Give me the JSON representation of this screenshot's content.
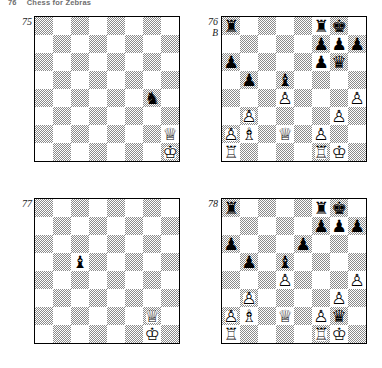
{
  "running_head": {
    "folio": "76",
    "title": "Chess for Zebras"
  },
  "pieces": {
    "wK": "♔",
    "wQ": "♕",
    "wR": "♖",
    "wB": "♗",
    "wN": "♘",
    "wP": "♙",
    "bK": "♚",
    "bQ": "♛",
    "bR": "♜",
    "bB": "♝",
    "bN": "♞",
    "bP": "♟"
  },
  "diagrams": [
    {
      "number": "75",
      "side_to_move": "",
      "x": 34,
      "y": 16,
      "label_x": 10,
      "label_y": 17,
      "position": [
        {
          "square": "g4",
          "piece": "bN"
        },
        {
          "square": "h2",
          "piece": "wQ"
        },
        {
          "square": "h1",
          "piece": "wK"
        }
      ]
    },
    {
      "number": "76",
      "side_to_move": "B",
      "x": 221,
      "y": 16,
      "label_x": 196,
      "label_y": 17,
      "position": [
        {
          "square": "a8",
          "piece": "bR"
        },
        {
          "square": "f8",
          "piece": "bR"
        },
        {
          "square": "g8",
          "piece": "bK"
        },
        {
          "square": "f7",
          "piece": "bP"
        },
        {
          "square": "g7",
          "piece": "bP"
        },
        {
          "square": "h7",
          "piece": "bP"
        },
        {
          "square": "a6",
          "piece": "bP"
        },
        {
          "square": "f6",
          "piece": "bP"
        },
        {
          "square": "g6",
          "piece": "bQ"
        },
        {
          "square": "b5",
          "piece": "bP"
        },
        {
          "square": "d5",
          "piece": "bB"
        },
        {
          "square": "d4",
          "piece": "wP"
        },
        {
          "square": "h4",
          "piece": "wP"
        },
        {
          "square": "b3",
          "piece": "wP"
        },
        {
          "square": "g3",
          "piece": "wP"
        },
        {
          "square": "a2",
          "piece": "wP"
        },
        {
          "square": "b2",
          "piece": "wB"
        },
        {
          "square": "d2",
          "piece": "wQ"
        },
        {
          "square": "f2",
          "piece": "wP"
        },
        {
          "square": "a1",
          "piece": "wR"
        },
        {
          "square": "f1",
          "piece": "wR"
        },
        {
          "square": "g1",
          "piece": "wK"
        }
      ]
    },
    {
      "number": "77",
      "side_to_move": "",
      "x": 34,
      "y": 198,
      "label_x": 10,
      "label_y": 199,
      "position": [
        {
          "square": "c5",
          "piece": "bB"
        },
        {
          "square": "g2",
          "piece": "wQ"
        },
        {
          "square": "g1",
          "piece": "wK"
        }
      ]
    },
    {
      "number": "78",
      "side_to_move": "",
      "x": 221,
      "y": 198,
      "label_x": 196,
      "label_y": 199,
      "position": [
        {
          "square": "a8",
          "piece": "bR"
        },
        {
          "square": "f8",
          "piece": "bR"
        },
        {
          "square": "g8",
          "piece": "bK"
        },
        {
          "square": "f7",
          "piece": "bP"
        },
        {
          "square": "g7",
          "piece": "bP"
        },
        {
          "square": "h7",
          "piece": "bP"
        },
        {
          "square": "a6",
          "piece": "bP"
        },
        {
          "square": "e6",
          "piece": "bP"
        },
        {
          "square": "b5",
          "piece": "bP"
        },
        {
          "square": "d5",
          "piece": "bB"
        },
        {
          "square": "d4",
          "piece": "wP"
        },
        {
          "square": "h4",
          "piece": "wP"
        },
        {
          "square": "b3",
          "piece": "wP"
        },
        {
          "square": "g3",
          "piece": "wP"
        },
        {
          "square": "a2",
          "piece": "wP"
        },
        {
          "square": "b2",
          "piece": "wB"
        },
        {
          "square": "d2",
          "piece": "wQ"
        },
        {
          "square": "f2",
          "piece": "wP"
        },
        {
          "square": "g2",
          "piece": "bQ"
        },
        {
          "square": "a1",
          "piece": "wR"
        },
        {
          "square": "f1",
          "piece": "wR"
        },
        {
          "square": "g1",
          "piece": "wK"
        }
      ]
    }
  ]
}
